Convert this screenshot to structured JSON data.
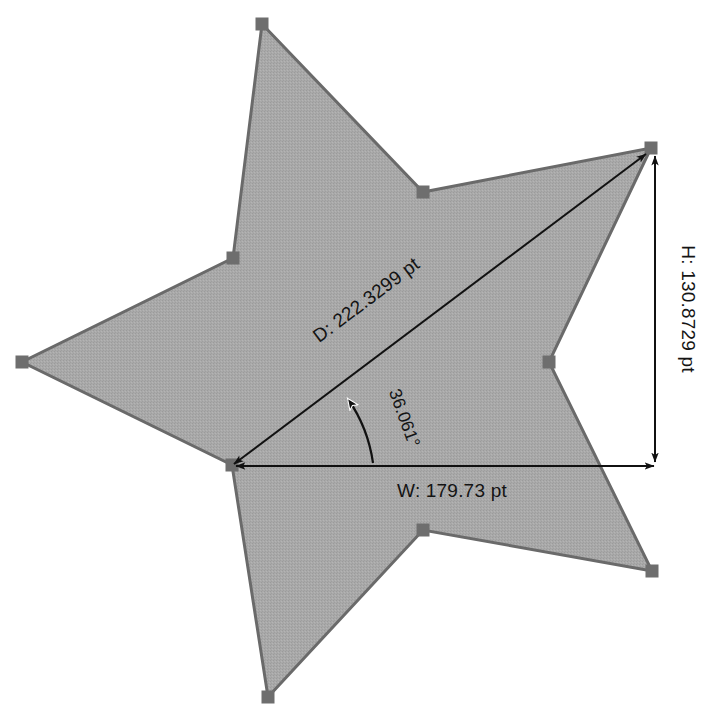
{
  "document": {
    "title": "Shape Measurement Overlay",
    "background_color": "#ffffff"
  },
  "shape": {
    "name": "5-point star",
    "fill_color": "#a6a6a6",
    "stroke_color": "#6a6a6a",
    "selected": true,
    "handle_color": "#6e6e6e",
    "handle_size_px": 13,
    "outer_points": 5,
    "vertices": [
      {
        "id": "outer-top",
        "x": 262,
        "y": 24,
        "kind": "outer"
      },
      {
        "id": "inner-top-right",
        "x": 423,
        "y": 192,
        "kind": "inner"
      },
      {
        "id": "outer-right",
        "x": 651,
        "y": 148,
        "kind": "outer"
      },
      {
        "id": "inner-right",
        "x": 549,
        "y": 362,
        "kind": "inner"
      },
      {
        "id": "outer-bottom-right",
        "x": 652,
        "y": 571,
        "kind": "outer"
      },
      {
        "id": "inner-bottom",
        "x": 423,
        "y": 530,
        "kind": "inner"
      },
      {
        "id": "outer-bottom",
        "x": 268,
        "y": 697,
        "kind": "outer"
      },
      {
        "id": "inner-bottom-left",
        "x": 232,
        "y": 465,
        "kind": "inner"
      },
      {
        "id": "outer-left",
        "x": 22,
        "y": 362,
        "kind": "outer"
      },
      {
        "id": "inner-top-left",
        "x": 233,
        "y": 258,
        "kind": "inner"
      }
    ]
  },
  "measurements": {
    "diagonal": {
      "label": "D: 222.3299 pt",
      "key": "D",
      "value": 222.3299,
      "unit": "pt",
      "from": {
        "x": 232,
        "y": 465
      },
      "to": {
        "x": 648,
        "y": 152
      },
      "rotation_deg": -36.9
    },
    "width": {
      "label": "W: 179.73 pt",
      "key": "W",
      "value": 179.73,
      "unit": "pt",
      "from": {
        "x": 232,
        "y": 466
      },
      "to": {
        "x": 656,
        "y": 466
      },
      "rotation_deg": 0
    },
    "height": {
      "label": "H: 130.8729 pt",
      "key": "H",
      "value": 130.8729,
      "unit": "pt",
      "from": {
        "x": 655,
        "y": 154
      },
      "to": {
        "x": 655,
        "y": 464
      },
      "rotation_deg": 90
    },
    "angle": {
      "label": "36.061°",
      "key": "angle",
      "value": 36.061,
      "unit": "°",
      "vertex": {
        "x": 232,
        "y": 466
      },
      "rotation_deg": 70
    }
  },
  "annotation_style": {
    "line_color": "#111111",
    "text_color": "#141414",
    "arrowhead": "solid-triangle"
  }
}
